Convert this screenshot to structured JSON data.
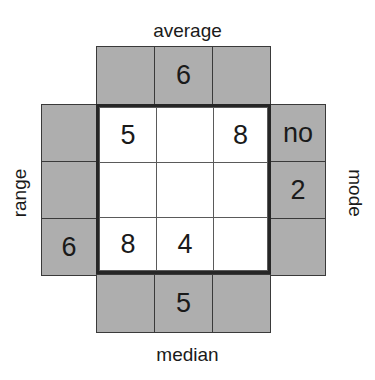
{
  "puzzle": {
    "title": "average-median-range-mode cross number puzzle",
    "colors": {
      "clue_fill": "#aeaeae",
      "answer_fill": "#ffffff",
      "border": "#3a3a3a",
      "heavy_border": "#262626",
      "text": "#1a1a1a"
    },
    "labels": {
      "top": "average",
      "bottom": "median",
      "left": "range",
      "right": "mode"
    },
    "clue_rows": {
      "top": [
        "",
        "6",
        ""
      ],
      "bottom": [
        "",
        "5",
        ""
      ]
    },
    "clue_cols": {
      "left": [
        "",
        "",
        "6"
      ],
      "right": [
        "no",
        "2",
        ""
      ]
    },
    "grid": [
      [
        "5",
        "",
        "8"
      ],
      [
        "",
        "",
        ""
      ],
      [
        "8",
        "4",
        ""
      ]
    ]
  }
}
